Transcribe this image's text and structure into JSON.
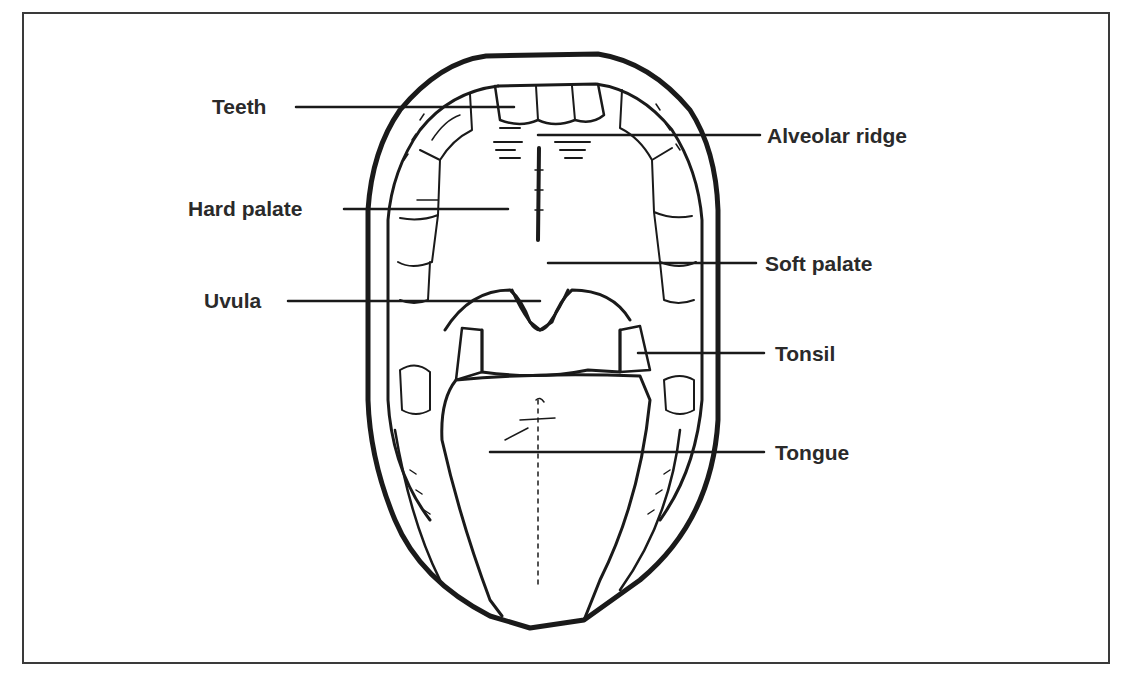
{
  "diagram": {
    "colors": {
      "line": "#1a1a1a",
      "text": "#2a2a2a",
      "frame": "#3a3a3a",
      "background": "#ffffff"
    },
    "labels_left": [
      {
        "id": "teeth",
        "text": "Teeth"
      },
      {
        "id": "hard-palate",
        "text": "Hard palate"
      },
      {
        "id": "uvula",
        "text": "Uvula"
      }
    ],
    "labels_right": [
      {
        "id": "alveolar-ridge",
        "text": "Alveolar ridge"
      },
      {
        "id": "soft-palate",
        "text": "Soft palate"
      },
      {
        "id": "tonsil",
        "text": "Tonsil"
      },
      {
        "id": "tongue",
        "text": "Tongue"
      }
    ]
  }
}
